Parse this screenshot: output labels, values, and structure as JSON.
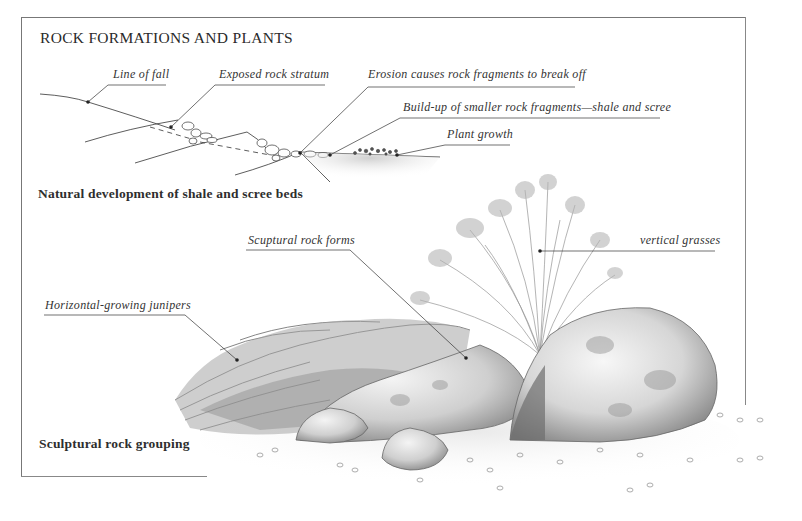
{
  "figure": {
    "title": "ROCK FORMATIONS AND PLANTS",
    "sections": [
      {
        "caption": "Natural development of shale and scree beds",
        "labels": [
          "Line of fall",
          "Exposed rock stratum",
          "Erosion causes rock fragments to break off",
          "Build-up of smaller rock fragments—shale and scree",
          "Plant growth"
        ]
      },
      {
        "caption": "Sculptural rock grouping",
        "labels": [
          "Scuptural rock forms",
          "vertical grasses",
          "Horizontal-growing junipers"
        ]
      }
    ]
  },
  "colors": {
    "ink": "#2a2a2a",
    "frame": "#777777",
    "rock_light": "#e6e6e6",
    "rock_mid": "#bdbdbd",
    "rock_dark": "#7a7a7a",
    "foliage": "#8a8a8a"
  }
}
